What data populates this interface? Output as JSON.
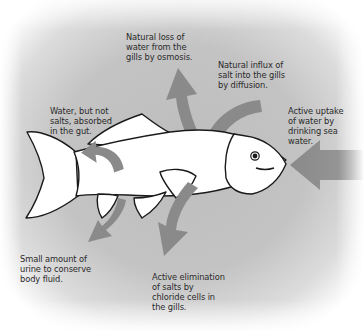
{
  "diagram": {
    "colors": {
      "background_center": "#b9b9b9",
      "background_edge": "#ffffff",
      "arrow": "#8a8a8a",
      "fish_fill": "#ffffff",
      "fish_outline": "#1a1a1a",
      "text": "#2a2a2a"
    },
    "labels": [
      {
        "id": "water_loss_gills",
        "text": "Natural loss of\nwater from the\ngills by osmosis."
      },
      {
        "id": "salt_influx_gills",
        "text": "Natural influx of\nsalt into the gills\nby diffusion."
      },
      {
        "id": "gut_absorption",
        "text": "Water, but not\nsalts, absorbed\nin the gut."
      },
      {
        "id": "drinking",
        "text": "Active uptake\nof water by\ndrinking sea\nwater."
      },
      {
        "id": "urine",
        "text": "Small amount of\nurine to conserve\nbody fluid."
      },
      {
        "id": "salt_elimination",
        "text": "Active elimination\nof salts by\nchloride cells in\nthe gills."
      }
    ],
    "arrows": [
      {
        "id": "water_loss_gills",
        "direction": "up-out-of-gills"
      },
      {
        "id": "salt_influx_gills",
        "direction": "curving-into-gills"
      },
      {
        "id": "gut_absorption",
        "direction": "curving-within-body"
      },
      {
        "id": "drinking",
        "direction": "leftward-into-mouth"
      },
      {
        "id": "urine",
        "direction": "down-out-of-vent"
      },
      {
        "id": "salt_elimination",
        "direction": "down-out-of-gills"
      }
    ]
  }
}
